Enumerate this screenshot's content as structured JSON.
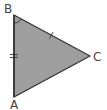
{
  "diagram": {
    "type": "triangle",
    "colors": {
      "fill": "#9e9e9e",
      "stroke": "#333333",
      "label": "#444444",
      "background": "#ffffff"
    },
    "vertices": [
      {
        "name": "B",
        "x": 14,
        "y": 15
      },
      {
        "name": "C",
        "x": 90,
        "y": 56
      },
      {
        "name": "A",
        "x": 14,
        "y": 97
      }
    ],
    "labels": {
      "B": "B",
      "C": "C",
      "A": "A"
    },
    "marks": {
      "side_AB": "double-tick",
      "side_BC": "single-tick",
      "angle_B": "arc"
    }
  }
}
